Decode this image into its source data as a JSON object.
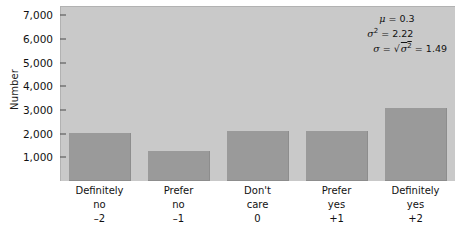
{
  "chart_data": {
    "type": "bar",
    "title": "",
    "xlabel": "",
    "ylabel": "Number",
    "categories": [
      "Definitely no",
      "Prefer no",
      "Don't care",
      "Prefer yes",
      "Definitely yes"
    ],
    "category_lines": [
      [
        "Definitely",
        "no",
        "–2"
      ],
      [
        "Prefer",
        "no",
        "–1"
      ],
      [
        "Don't",
        "care",
        "0"
      ],
      [
        "Prefer",
        "yes",
        "+1"
      ],
      [
        "Definitely",
        "yes",
        "+2"
      ]
    ],
    "x_values": [
      -2,
      -1,
      0,
      1,
      2
    ],
    "values": [
      2050,
      1250,
      2100,
      2100,
      3100
    ],
    "ylim": [
      0,
      7400
    ],
    "yticks": [
      1000,
      2000,
      3000,
      4000,
      5000,
      6000,
      7000
    ],
    "ytick_labels": [
      "1,000",
      "2,000",
      "3,000",
      "4,000",
      "5,000",
      "6,000",
      "7,000"
    ],
    "grid": false,
    "legend": "none",
    "bar_color": "#9a9a9a",
    "plot_background": "#c9c9c9",
    "page_background": "#ffffff"
  },
  "annotation": {
    "mean_symbol": "μ",
    "mean_text": "μ = 0.3",
    "variance_text": "σ² = 2.22",
    "sd_text": "σ = √σ² = 1.49",
    "mean_value": "0.3",
    "variance_value": "2.22",
    "sd_value": "1.49",
    "mean_label": "μ",
    "variance_label": "σ",
    "variance_exp": "2",
    "sd_label": "σ",
    "eq": "=",
    "radical_sigma": "σ",
    "radical_exp": "2"
  },
  "axis": {
    "y_title": "Number"
  }
}
